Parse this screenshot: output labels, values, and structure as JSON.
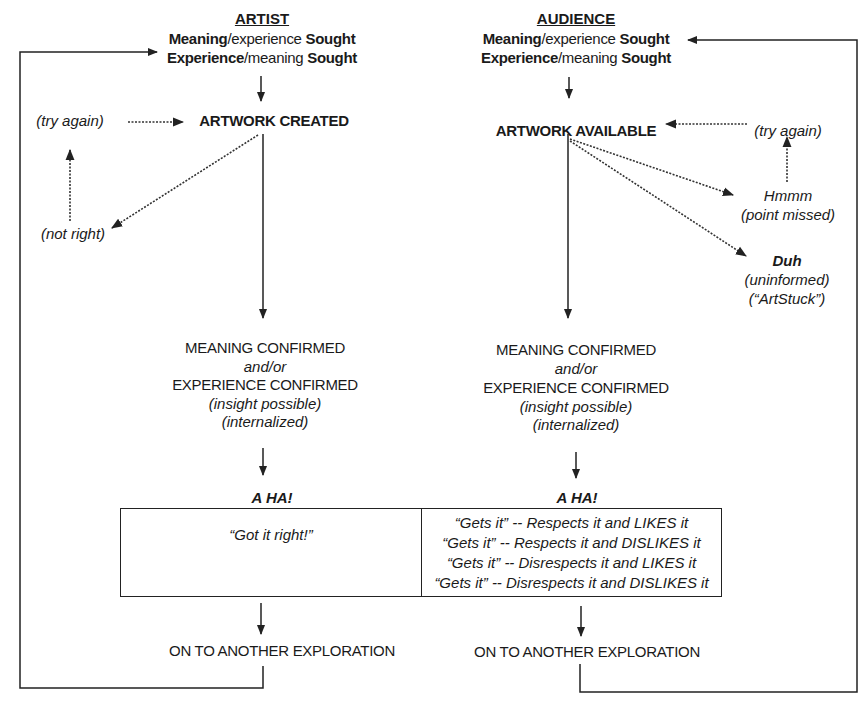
{
  "artist": {
    "heading": "ARTIST",
    "sought_lines": [
      {
        "bold": "Meaning",
        "normal": "/experience ",
        "bold2": "Sought"
      },
      {
        "bold": "Experience",
        "normal": "/meaning ",
        "bold2": "Sought"
      }
    ],
    "main_node": "ARTWORK CREATED",
    "retry_label": "(try again)",
    "fail_label": "(not right)",
    "confirm": {
      "line1": "MEANING CONFIRMED",
      "line2": "and/or",
      "line3": "EXPERIENCE CONFIRMED",
      "line4": "(insight possible)",
      "line5": "(internalized)"
    },
    "aha": "A HA!",
    "outcome": "“Got it right!”",
    "next": "ON TO ANOTHER EXPLORATION"
  },
  "audience": {
    "heading": "AUDIENCE",
    "sought_lines": [
      {
        "bold": "Meaning",
        "normal": "/experience ",
        "bold2": "Sought"
      },
      {
        "bold": "Experience",
        "normal": "/meaning ",
        "bold2": "Sought"
      }
    ],
    "main_node": "ARTWORK AVAILABLE",
    "retry_label": "(try again)",
    "missed": {
      "line1": "Hmmm",
      "line2": "(point missed)"
    },
    "duh": {
      "line1": "Duh",
      "line2": "(uninformed)",
      "line3": "(“ArtStuck”)"
    },
    "confirm": {
      "line1": "MEANING CONFIRMED",
      "line2": "and/or",
      "line3": "EXPERIENCE CONFIRMED",
      "line4": "(insight possible)",
      "line5": "(internalized)"
    },
    "aha": "A HA!",
    "outcomes": [
      "“Gets it” -- Respects it and LIKES it",
      "“Gets it” -- Respects it and DISLIKES it",
      "“Gets it” -- Disrespects it and LIKES it",
      "“Gets it” -- Disrespects it and DISLIKES it"
    ],
    "next": "ON TO ANOTHER EXPLORATION"
  },
  "colors": {
    "line": "#222222",
    "text": "#1a1a1a",
    "background": "#ffffff"
  }
}
